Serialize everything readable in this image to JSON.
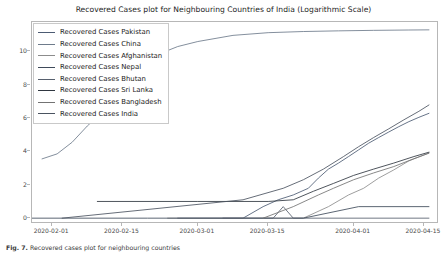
{
  "chart_data": {
    "type": "line",
    "title": "Recovered Cases plot for Neighbouring Countries of India (Logarithmic Scale)",
    "xlabel": "",
    "ylabel": "",
    "grid": false,
    "legend_position": "upper left",
    "xlim": [
      "2020-01-28",
      "2020-04-18"
    ],
    "ylim": [
      -0.35,
      11.75
    ],
    "yticks": [
      0,
      2,
      4,
      6,
      8,
      10
    ],
    "ytick_labels": [
      "0",
      "2",
      "4",
      "6",
      "8",
      "10"
    ],
    "xticks": [
      "2020-02-01",
      "2020-02-15",
      "2020-03-01",
      "2020-03-15",
      "2020-04-01",
      "2020-04-15"
    ],
    "xtick_labels": [
      "2020-02-01",
      "2020-02-15",
      "2020-03-01",
      "2020-03-15",
      "2020-04-01",
      "2020-04-15"
    ],
    "series": [
      {
        "name": "Recovered Cases Pakistan",
        "color": "#4c5b73",
        "x": [
          "2020-02-26",
          "2020-03-10",
          "2020-03-14",
          "2020-03-17",
          "2020-03-20",
          "2020-03-23",
          "2020-03-25",
          "2020-03-27",
          "2020-03-29",
          "2020-03-31",
          "2020-04-02",
          "2020-04-04",
          "2020-04-06",
          "2020-04-08",
          "2020-04-10",
          "2020-04-12",
          "2020-04-14",
          "2020-04-16"
        ],
        "values": [
          0,
          0,
          0.69,
          1.1,
          1.39,
          1.79,
          2.4,
          2.94,
          3.3,
          3.69,
          4.09,
          4.49,
          4.83,
          5.16,
          5.48,
          5.78,
          6.04,
          6.28
        ]
      },
      {
        "name": "Recovered Cases China",
        "color": "#6e7b8b",
        "x": [
          "2020-01-30",
          "2020-02-02",
          "2020-02-05",
          "2020-02-08",
          "2020-02-11",
          "2020-02-14",
          "2020-02-17",
          "2020-02-20",
          "2020-02-23",
          "2020-02-26",
          "2020-03-01",
          "2020-03-08",
          "2020-03-15",
          "2020-03-22",
          "2020-03-29",
          "2020-04-05",
          "2020-04-12",
          "2020-04-16"
        ],
        "values": [
          3.55,
          3.85,
          4.55,
          5.52,
          6.35,
          7.3,
          8.38,
          9.35,
          9.92,
          10.28,
          10.58,
          10.95,
          11.11,
          11.18,
          11.22,
          11.25,
          11.27,
          11.28
        ]
      },
      {
        "name": "Recovered Cases Afghanistan",
        "color": "#8c8c8c",
        "x": [
          "2020-02-24",
          "2020-03-15",
          "2020-03-22",
          "2020-03-27",
          "2020-03-31",
          "2020-04-03",
          "2020-04-06",
          "2020-04-09",
          "2020-04-12",
          "2020-04-16"
        ],
        "values": [
          0,
          0,
          0,
          0.69,
          1.39,
          1.79,
          2.4,
          2.89,
          3.43,
          3.91
        ]
      },
      {
        "name": "Recovered Cases Nepal",
        "color": "#3f4a5a",
        "x": [
          "2020-01-25",
          "2020-02-20",
          "2020-03-14",
          "2020-03-16",
          "2020-03-22",
          "2020-04-02",
          "2020-04-16"
        ],
        "values": [
          0,
          0,
          0,
          0,
          0,
          0.69,
          0.69
        ]
      },
      {
        "name": "Recovered Cases Bhutan",
        "color": "#57606e",
        "x": [
          "2020-03-06",
          "2020-03-16",
          "2020-03-18",
          "2020-03-20",
          "2020-03-22",
          "2020-04-16"
        ],
        "values": [
          0,
          0,
          0.69,
          0,
          0,
          0
        ]
      },
      {
        "name": "Recovered Cases Sri Lanka",
        "color": "#2f3640",
        "x": [
          "2020-02-10",
          "2020-03-01",
          "2020-03-15",
          "2020-03-20",
          "2020-03-24",
          "2020-03-28",
          "2020-04-01",
          "2020-04-05",
          "2020-04-09",
          "2020-04-13",
          "2020-04-16"
        ],
        "values": [
          1.0,
          1.0,
          1.0,
          1.1,
          1.61,
          2.08,
          2.56,
          2.94,
          3.3,
          3.69,
          3.95
        ]
      },
      {
        "name": "Recovered Cases Bangladesh",
        "color": "#737373",
        "x": [
          "2020-03-14",
          "2020-03-20",
          "2020-03-25",
          "2020-03-28",
          "2020-04-01",
          "2020-04-05",
          "2020-04-09",
          "2020-04-13",
          "2020-04-16"
        ],
        "values": [
          0,
          0.69,
          1.39,
          1.79,
          2.3,
          2.71,
          3.09,
          3.56,
          3.89
        ]
      },
      {
        "name": "Recovered Cases India",
        "color": "#4a5360",
        "x": [
          "2020-02-03",
          "2020-03-10",
          "2020-03-18",
          "2020-03-22",
          "2020-03-26",
          "2020-03-30",
          "2020-04-02",
          "2020-04-05",
          "2020-04-08",
          "2020-04-11",
          "2020-04-14",
          "2020-04-16"
        ],
        "values": [
          0,
          1.1,
          1.79,
          2.3,
          2.94,
          3.69,
          4.28,
          4.83,
          5.35,
          5.89,
          6.4,
          6.78
        ]
      }
    ]
  },
  "legend": {
    "items": [
      {
        "label": "Recovered Cases Pakistan",
        "color": "#4c5b73"
      },
      {
        "label": "Recovered Cases China",
        "color": "#6e7b8b"
      },
      {
        "label": "Recovered Cases Afghanistan",
        "color": "#8c8c8c"
      },
      {
        "label": "Recovered Cases Nepal",
        "color": "#3f4a5a"
      },
      {
        "label": "Recovered Cases Bhutan",
        "color": "#57606e"
      },
      {
        "label": "Recovered Cases Sri Lanka",
        "color": "#2f3640"
      },
      {
        "label": "Recovered Cases Bangladesh",
        "color": "#737373"
      },
      {
        "label": "Recovered Cases India",
        "color": "#4a5360"
      }
    ]
  },
  "caption": {
    "prefix": "Fig. 7.",
    "text": "Recovered cases plot for neighbouring countries"
  }
}
